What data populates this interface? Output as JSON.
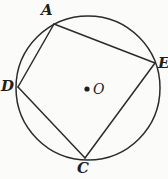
{
  "figure": {
    "type": "geometry-diagram",
    "background_color": "#fbfbf9",
    "stroke_color": "#2b2b2b",
    "label_color": "#1f1f1f",
    "circle": {
      "center": {
        "x": 88,
        "y": 88
      },
      "radius": 72,
      "center_dot_label": "O",
      "center_dot_radius": 2.6
    },
    "vertices": [
      {
        "id": "A",
        "label": "A",
        "x": 54,
        "y": 24,
        "label_x": 41,
        "label_y": 3
      },
      {
        "id": "E",
        "label": "E",
        "x": 155,
        "y": 63,
        "label_x": 158,
        "label_y": 56
      },
      {
        "id": "C",
        "label": "C",
        "x": 85,
        "y": 158,
        "label_x": 77,
        "label_y": 161
      },
      {
        "id": "D",
        "label": "D",
        "x": 18,
        "y": 87,
        "label_x": 1,
        "label_y": 79
      }
    ],
    "chords": [
      {
        "id": "AE",
        "from": "A",
        "to": "E"
      },
      {
        "id": "EC",
        "from": "E",
        "to": "C"
      },
      {
        "id": "CD",
        "from": "C",
        "to": "D"
      },
      {
        "id": "DA",
        "from": "D",
        "to": "A"
      }
    ]
  }
}
